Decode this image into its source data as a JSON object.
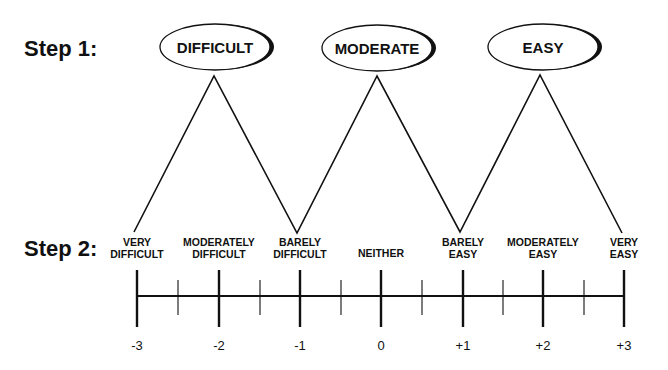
{
  "steps": {
    "step1_label": "Step 1:",
    "step2_label": "Step 2:"
  },
  "step1_options": [
    {
      "label": "DIFFICULT",
      "cx": 215,
      "cy": 47
    },
    {
      "label": "MODERATE",
      "cx": 377,
      "cy": 48
    },
    {
      "label": "EASY",
      "cx": 543,
      "cy": 47
    }
  ],
  "step2_categories": [
    {
      "line1": "VERY",
      "line2": "DIFFICULT",
      "x": 137
    },
    {
      "line1": "MODERATELY",
      "line2": "DIFFICULT",
      "x": 219
    },
    {
      "line1": "BARELY",
      "line2": "DIFFICULT",
      "x": 300
    },
    {
      "line1": "NEITHER",
      "line2": "",
      "x": 381
    },
    {
      "line1": "BARELY",
      "line2": "EASY",
      "x": 463
    },
    {
      "line1": "MODERATELY",
      "line2": "EASY",
      "x": 543
    },
    {
      "line1": "VERY",
      "line2": "EASY",
      "x": 624
    }
  ],
  "scale": {
    "values": [
      "-3",
      "-2",
      "-1",
      "0",
      "+1",
      "+2",
      "+3"
    ],
    "major_x": [
      137,
      219,
      300,
      381,
      463,
      543,
      624
    ],
    "minor_x": [
      178,
      260,
      341,
      422,
      503,
      584
    ]
  },
  "zigzag_points": [
    [
      134,
      232
    ],
    [
      214,
      76
    ],
    [
      297,
      233
    ],
    [
      377,
      76
    ],
    [
      460,
      232
    ],
    [
      540,
      75
    ],
    [
      622,
      233
    ]
  ],
  "colors": {
    "ink": "#111111",
    "background": "#ffffff"
  }
}
